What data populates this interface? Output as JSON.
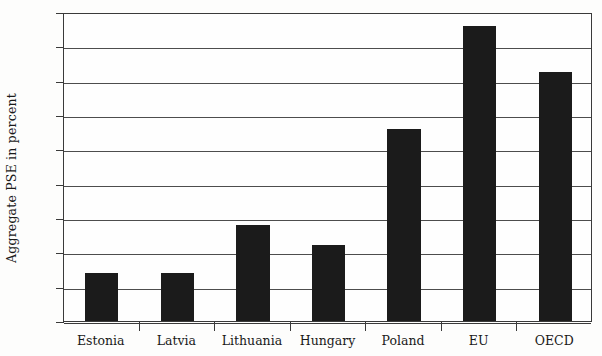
{
  "chart_data": {
    "type": "bar",
    "title": "",
    "subtitle": "",
    "xlabel": "",
    "ylabel": "Aggregate PSE in percent",
    "categories": [
      "Estonia",
      "Latvia",
      "Lithuania",
      "Hungary",
      "Poland",
      "EU",
      "OECD"
    ],
    "values": [
      7,
      7,
      14,
      11,
      28,
      43,
      36.3
    ],
    "series": [
      {
        "name": "Aggregate PSE",
        "values": [
          7,
          7,
          14,
          11,
          28,
          43,
          36.3
        ]
      }
    ],
    "ylim": [
      0,
      45
    ],
    "ytick_step": 5,
    "ytick_labels": [
      "0",
      "5",
      "10",
      "15",
      "20",
      "25",
      "30",
      "35",
      "40",
      "45"
    ],
    "ytick_values": [
      0,
      5,
      10,
      15,
      20,
      25,
      30,
      35,
      40,
      45
    ],
    "grid": "horizontal",
    "legend": "none",
    "annotations": [],
    "bar_color": "#1b1b1b",
    "axis_color": "#3a3a3a",
    "grid_color": "#4d4d4d",
    "background_color": "#fefefe"
  }
}
